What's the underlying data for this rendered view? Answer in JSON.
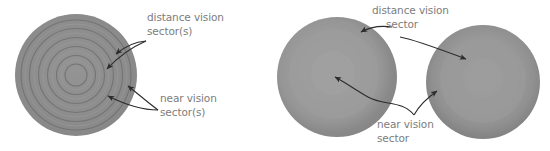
{
  "figure": {
    "background_color": "#ffffff",
    "annotation_text_color": "#7d7d7d",
    "arrow_color": "#2b2b2b"
  },
  "labels": {
    "distance_left_line1": "distance vision",
    "distance_left_line2": "sector(s)",
    "near_left_line1": "near vision",
    "near_left_line2": "sector(s)",
    "distance_right_line1": "distance vision",
    "distance_right_line2": "sector",
    "near_right_line1": "near vision",
    "near_right_line2": "sector"
  },
  "panels": [
    {
      "name": "left-panel-concentric-lens",
      "disc": {
        "center_x": 76,
        "center_y": 75,
        "radius": 61,
        "fill": "#8e8e8e",
        "ring_count": 6,
        "ring_radii": [
          61,
          50,
          41,
          32,
          23,
          14,
          8
        ],
        "ring_stroke": "#6f6f6f"
      },
      "annotations": [
        {
          "name": "distance-vision-sector-left",
          "arrow_count": 2
        },
        {
          "name": "near-vision-sector-left",
          "arrow_count": 2
        }
      ]
    },
    {
      "name": "right-panel-graded-lenses",
      "discs": [
        {
          "name": "graded-disc-center",
          "center_x": 337,
          "center_y": 77,
          "radius": 60,
          "outer_fill": "#8a8a8a",
          "inner_fill": "#9c9c9c",
          "inner_radius": 46
        },
        {
          "name": "graded-disc-right",
          "center_x": 483,
          "center_y": 82,
          "radius": 57,
          "outer_fill": "#858585",
          "inner_fill": "#9a9a9a",
          "inner_radius": 43
        }
      ],
      "annotations": [
        {
          "name": "distance-vision-sector-right",
          "arrow_count": 2
        },
        {
          "name": "near-vision-sector-right",
          "arrow_count": 2
        }
      ]
    }
  ]
}
